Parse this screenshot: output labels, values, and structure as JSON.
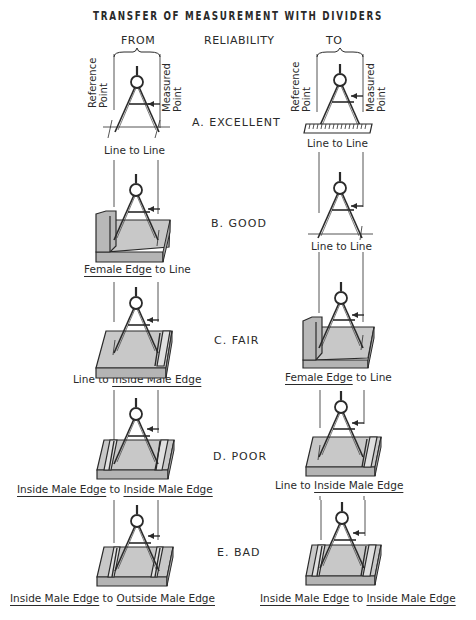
{
  "title": "TRANSFER OF MEASUREMENT WITH DIVIDERS",
  "headers": {
    "from": "FROM",
    "reliability": "RELIABILITY",
    "to": "TO"
  },
  "axis_labels": {
    "reference_line1": "Reference",
    "reference_line2": "Point",
    "measured_line1": "Measured",
    "measured_line2": "Point"
  },
  "rows": [
    {
      "rating": "A.  EXCELLENT",
      "from": {
        "surface": "line",
        "caption_parts": [
          "Line to Line"
        ],
        "underlined": []
      },
      "to": {
        "surface": "scale",
        "caption_parts": [
          "Line to Line"
        ],
        "underlined": []
      }
    },
    {
      "rating": "B.  GOOD",
      "from": {
        "surface": "female-edge",
        "caption_parts": [
          "Female Edge",
          " to Line"
        ],
        "underlined": [
          0
        ]
      },
      "to": {
        "surface": "line",
        "caption_parts": [
          "Line to Line"
        ],
        "underlined": []
      }
    },
    {
      "rating": "C.  FAIR",
      "from": {
        "surface": "inside-male-edge-right",
        "caption_parts": [
          "Line to ",
          "Inside Male Edge"
        ],
        "underlined": [
          1
        ]
      },
      "to": {
        "surface": "female-edge",
        "caption_parts": [
          "Female Edge",
          " to Line"
        ],
        "underlined": [
          0
        ]
      }
    },
    {
      "rating": "D.  POOR",
      "from": {
        "surface": "inside-male-both",
        "caption_parts": [
          "Inside Male Edge",
          " to ",
          "Inside Male Edge"
        ],
        "underlined": [
          0,
          2
        ]
      },
      "to": {
        "surface": "inside-male-edge-right",
        "caption_parts": [
          "Line to ",
          "Inside Male Edge"
        ],
        "underlined": [
          1
        ]
      }
    },
    {
      "rating": "E.  BAD",
      "from": {
        "surface": "outside-male-both",
        "caption_parts": [
          "Inside Male Edge",
          " to ",
          "Outside Male Edge"
        ],
        "underlined": [
          0,
          2
        ]
      },
      "to": {
        "surface": "inside-male-both",
        "caption_parts": [
          "Inside Male Edge",
          " to ",
          "Inside Male Edge"
        ],
        "underlined": [
          0,
          2
        ]
      }
    }
  ],
  "colors": {
    "ink": "#2a2a2a",
    "block_fill": "#c8c8c8",
    "block_side": "#b4b4b4"
  }
}
